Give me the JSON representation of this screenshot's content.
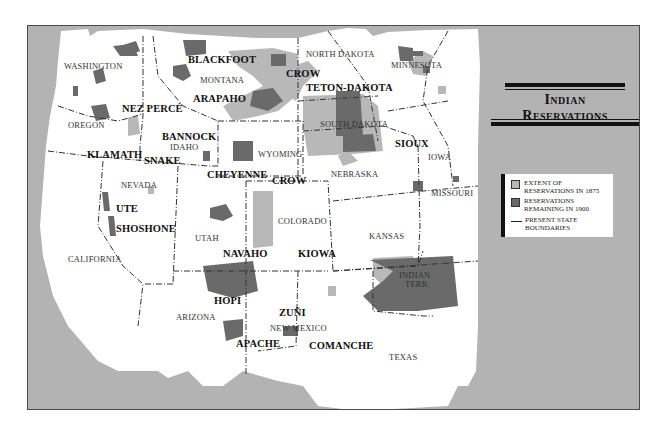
{
  "title": {
    "line1": "Indian",
    "line2": "Reservations"
  },
  "legend": {
    "items": [
      {
        "label1": "EXTENT OF",
        "label2": "RESERVATIONS IN 1875",
        "swatch": "#b8b8b8",
        "kind": "area"
      },
      {
        "label1": "RESERVATIONS",
        "label2": "REMAINING IN 1900",
        "swatch": "#6a6a6a",
        "kind": "area"
      },
      {
        "label1": "PRESENT STATE",
        "label2": "BOUNDARIES",
        "kind": "line"
      }
    ]
  },
  "colors": {
    "ocean_background": "#b3b3b3",
    "land": "#ffffff",
    "extent_1875": "#b8b8b8",
    "remaining_1900": "#6a6a6a",
    "boundary": "#333333"
  },
  "states": {
    "washington": "WASHINGTON",
    "oregon": "OREGON",
    "california": "CALIFORNIA",
    "idaho": "IDAHO",
    "nevada": "NEVADA",
    "montana": "MONTANA",
    "wyoming": "WYOMING",
    "utah": "UTAH",
    "arizona": "ARIZONA",
    "colorado": "COLORADO",
    "new_mexico": "NEW MEXICO",
    "north_dakota": "NORTH DAKOTA",
    "south_dakota": "SOUTH DAKOTA",
    "nebraska": "NEBRASKA",
    "kansas": "KANSAS",
    "texas": "TEXAS",
    "minnesota": "MINNESOTA",
    "iowa": "IOWA",
    "missouri": "MISSOURI",
    "indian_terr_1": "INDIAN",
    "indian_terr_2": "TERR."
  },
  "tribes": {
    "blackfoot": "BLACKFOOT",
    "crow_north": "CROW",
    "teton_dakota": "TETON-DAKOTA",
    "nez_perce": "NEZ PERCÉ",
    "arapaho": "ARAPAHO",
    "bannock": "BANNOCK",
    "klamath": "KLAMATH",
    "snake": "SNAKE",
    "sioux": "SIOUX",
    "cheyenne": "CHEYENNE",
    "crow_south": "CROW",
    "ute": "UTE",
    "shoshone": "SHOSHONE",
    "navaho": "NAVAHO",
    "kiowa": "KIOWA",
    "hopi": "HOPI",
    "zuni": "ZUÑI",
    "apache": "APACHE",
    "comanche": "COMANCHE"
  }
}
